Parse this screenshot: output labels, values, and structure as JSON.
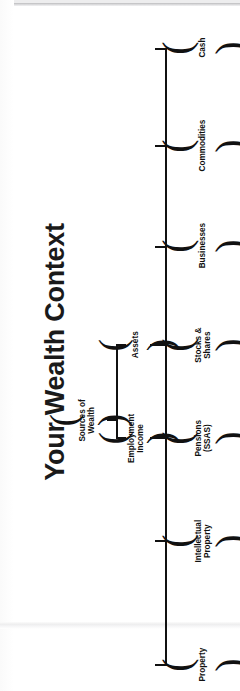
{
  "page": {
    "title": "Your Wealth Context",
    "orientation": "rotated-90-ccw",
    "ink_color": "#111111",
    "background_color": "#ffffff"
  },
  "diagram": {
    "type": "tree",
    "root": {
      "label": "Sources of\nWealth"
    },
    "branches": [
      {
        "id": "assets",
        "label": "Assets"
      },
      {
        "id": "employment-income",
        "label": "Employment\nIncome"
      }
    ],
    "leaves": [
      {
        "id": "cash",
        "label": "Cash",
        "parent": "assets"
      },
      {
        "id": "commodities",
        "label": "Commodities",
        "parent": "assets"
      },
      {
        "id": "businesses",
        "label": "Businesses",
        "parent": "assets"
      },
      {
        "id": "stocks-shares",
        "label": "Stocks & Shares",
        "parent": "assets"
      },
      {
        "id": "pensions-ssas",
        "label": "Pensions (SSAS)",
        "parent": "employment-income"
      },
      {
        "id": "intellectual-property",
        "label": "Intellectual\nProperty",
        "parent": "employment-income"
      },
      {
        "id": "property",
        "label": "Property",
        "parent": "employment-income"
      }
    ]
  }
}
